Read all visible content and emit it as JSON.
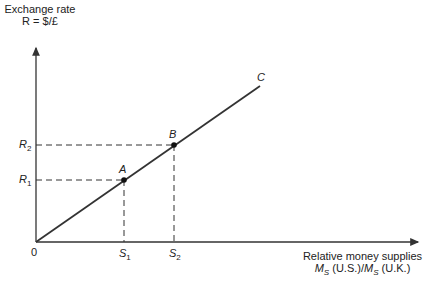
{
  "diagram": {
    "y_axis": {
      "label_line1": "Exchange rate",
      "label_line2": "R = $/£"
    },
    "x_axis": {
      "label_line1": "Relative money supplies",
      "label_line2_a": "M",
      "label_line2_a_sub": "S",
      "label_line2_b": " (U.S.)/",
      "label_line2_c": "M",
      "label_line2_c_sub": "S",
      "label_line2_d": " (U.K.)"
    },
    "origin_label": "0",
    "line_label": "C",
    "points": [
      {
        "label": "A",
        "x_tick": "S",
        "x_tick_sub": "1",
        "y_tick": "R",
        "y_tick_sub": "1"
      },
      {
        "label": "B",
        "x_tick": "S",
        "x_tick_sub": "2",
        "y_tick": "R",
        "y_tick_sub": "2"
      }
    ]
  },
  "colors": {
    "line": "#333333",
    "text": "#222222",
    "background": "#ffffff"
  }
}
